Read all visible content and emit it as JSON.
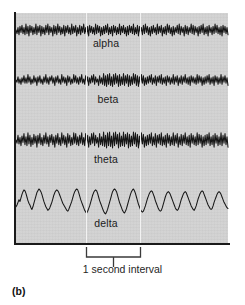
{
  "figure": {
    "panel_label": "(b)",
    "interval_caption": "1 second interval",
    "background_color": "#ffffff",
    "plot_background_color": "#d2d2d2",
    "trace_color": "#161616",
    "axis_color": "#1a1a1a",
    "marker_line_color": "#f2f2f2"
  },
  "bands": [
    {
      "label": "alpha",
      "label_x": 106,
      "label_y": 44,
      "baseline_y": 17,
      "amplitude": 6.0
    },
    {
      "label": "beta",
      "label_x": 108,
      "label_y": 100,
      "baseline_y": 67,
      "amplitude": 6.5
    },
    {
      "label": "theta",
      "label_x": 106,
      "label_y": 160,
      "baseline_y": 127,
      "amplitude": 8.0
    },
    {
      "label": "delta",
      "label_x": 106,
      "label_y": 224,
      "baseline_y": 192,
      "amplitude": 16.0
    }
  ],
  "interval_markers": {
    "x_start": 86,
    "x_end": 140,
    "label": "1 second interval"
  },
  "chart_data": {
    "type": "line",
    "title": "",
    "xlabel": "1 second interval",
    "ylabel": "",
    "grid": false,
    "legend": "inline-labels",
    "x_range": [
      0,
      212
    ],
    "series": [
      {
        "name": "alpha",
        "description": "Moderate-frequency, low-amplitude regular oscillation (~10 Hz)",
        "values": [
          0,
          -3,
          2,
          -4,
          3,
          -2,
          4,
          -3,
          2,
          -4,
          5,
          -3,
          3,
          -5,
          4,
          -2,
          3,
          -4,
          2,
          -3,
          5,
          -4,
          3,
          -2,
          4,
          -5,
          3,
          -3,
          2,
          -4,
          4,
          -2,
          5,
          -4,
          3,
          -2,
          2,
          -5,
          4,
          -3,
          3,
          -4,
          5,
          -2,
          3,
          -4,
          2,
          -3,
          4,
          -5,
          3,
          -2,
          4,
          -3,
          2,
          -4,
          5,
          -3,
          3,
          -2,
          4,
          -5,
          2,
          -3,
          4,
          -4,
          3,
          -2,
          5,
          -3,
          2,
          -4,
          3,
          -5,
          4,
          -2,
          3,
          -3,
          2,
          -4,
          5,
          -3,
          4,
          -2,
          3,
          -5,
          2,
          -4,
          3,
          -3,
          4,
          -2,
          5,
          -4,
          2,
          -3,
          3,
          -5,
          4,
          -2,
          3,
          -4,
          2,
          -3,
          5,
          -4,
          3,
          -2,
          4,
          -3,
          2,
          -5,
          3,
          -4,
          4,
          -2,
          3,
          -3,
          5,
          -4,
          2,
          -3,
          4,
          -5,
          3,
          -2,
          2,
          -4,
          4,
          -3,
          5,
          -2,
          3,
          -4,
          2,
          -5,
          3,
          -3,
          4,
          -2,
          2,
          -4,
          5,
          -3,
          3,
          -2,
          4,
          -5,
          2,
          -3,
          3,
          -4,
          5,
          -2,
          4,
          -3,
          2,
          -5,
          3,
          -4,
          2,
          -2,
          4,
          -3,
          5,
          -4,
          3,
          -2,
          2,
          -5,
          4,
          -3,
          3,
          -4,
          2,
          -2,
          5,
          -3,
          4,
          -4,
          3,
          -2,
          2,
          -5,
          3,
          -3,
          4,
          -2,
          5,
          -4,
          2,
          -3,
          3,
          -5,
          4,
          -2,
          2,
          -4,
          3,
          -3,
          5,
          -2,
          4,
          -3,
          2,
          -4,
          3,
          -5,
          4,
          -2,
          3,
          -3,
          2,
          -4
        ]
      },
      {
        "name": "beta",
        "description": "High-frequency, low-amplitude fast activity (~20 Hz) with a burst mid-trace",
        "values": [
          0,
          -2,
          3,
          -3,
          1,
          -4,
          2,
          -2,
          4,
          -3,
          2,
          -3,
          5,
          -2,
          3,
          -4,
          1,
          -3,
          4,
          -2,
          2,
          -5,
          3,
          -2,
          4,
          -3,
          1,
          -4,
          3,
          -2,
          5,
          -3,
          2,
          -4,
          3,
          -1,
          4,
          -3,
          2,
          -5,
          3,
          -2,
          4,
          -3,
          1,
          -4,
          5,
          -2,
          3,
          -3,
          2,
          -5,
          4,
          -2,
          3,
          -4,
          1,
          -3,
          5,
          -2,
          4,
          -3,
          2,
          -4,
          3,
          -2,
          5,
          -3,
          1,
          -4,
          4,
          -2,
          3,
          -5,
          2,
          -3,
          4,
          -2,
          5,
          -4,
          3,
          -2,
          1,
          -5,
          4,
          -3,
          2,
          -4,
          6,
          -5,
          4,
          -6,
          5,
          -4,
          6,
          -5,
          3,
          -6,
          5,
          -4,
          6,
          -3,
          4,
          -6,
          5,
          -5,
          3,
          -4,
          6,
          -5,
          4,
          -3,
          5,
          -6,
          4,
          -5,
          3,
          -4,
          6,
          -3,
          5,
          -5,
          4,
          -6,
          3,
          -4,
          5,
          -3,
          4,
          -5,
          2,
          -4,
          3,
          -3,
          4,
          -2,
          5,
          -4,
          2,
          -3,
          4,
          -5,
          3,
          -2,
          4,
          -3,
          5,
          -4,
          2,
          -3,
          3,
          -5,
          4,
          -2,
          3,
          -4,
          2,
          -3,
          5,
          -4,
          3,
          -2,
          4,
          -5,
          2,
          -3,
          4,
          -4,
          3,
          -2,
          5,
          -3,
          2,
          -4,
          3,
          -5,
          4,
          -2,
          3,
          -3,
          2,
          -4,
          5,
          -3,
          4,
          -2,
          3,
          -5,
          2,
          -4,
          3,
          -3,
          4,
          -2,
          5,
          -4,
          2,
          -3,
          3,
          -5,
          4,
          -2,
          3,
          -4,
          2,
          -3,
          5,
          -4,
          3,
          -2,
          4,
          -3,
          2,
          -5
        ]
      },
      {
        "name": "theta",
        "description": "Slower irregular waves (~5 Hz) with moderate amplitude",
        "values": [
          0,
          -4,
          6,
          -5,
          3,
          -7,
          5,
          -3,
          8,
          -6,
          4,
          -7,
          9,
          -5,
          6,
          -8,
          3,
          -6,
          7,
          -4,
          5,
          -9,
          6,
          -4,
          8,
          -6,
          3,
          -7,
          6,
          -4,
          9,
          -5,
          4,
          -8,
          6,
          -3,
          7,
          -6,
          4,
          -9,
          6,
          -4,
          8,
          -6,
          3,
          -7,
          9,
          -4,
          6,
          -6,
          4,
          -9,
          8,
          -4,
          6,
          -7,
          3,
          -6,
          9,
          -4,
          8,
          -6,
          4,
          -7,
          6,
          -4,
          9,
          -6,
          3,
          -7,
          8,
          -4,
          6,
          -9,
          4,
          -6,
          8,
          -4,
          9,
          -7,
          6,
          -4,
          3,
          -9,
          8,
          -6,
          4,
          -7,
          10,
          -8,
          6,
          -10,
          9,
          -7,
          10,
          -8,
          5,
          -10,
          9,
          -7,
          10,
          -5,
          7,
          -10,
          9,
          -8,
          5,
          -7,
          10,
          -8,
          7,
          -5,
          9,
          -10,
          7,
          -8,
          5,
          -7,
          10,
          -5,
          9,
          -8,
          7,
          -10,
          5,
          -7,
          9,
          -5,
          7,
          -9,
          4,
          -7,
          6,
          -6,
          7,
          -4,
          9,
          -7,
          4,
          -6,
          8,
          -9,
          6,
          -4,
          7,
          -6,
          9,
          -7,
          4,
          -6,
          6,
          -9,
          8,
          -4,
          6,
          -7,
          4,
          -6,
          9,
          -7,
          6,
          -4,
          8,
          -9,
          4,
          -6,
          7,
          -7,
          6,
          -4,
          9,
          -6,
          4,
          -7,
          6,
          -9,
          8,
          -4,
          6,
          -6,
          4,
          -7,
          9,
          -6,
          7,
          -4,
          6,
          -9,
          4,
          -7,
          6,
          -6,
          7,
          -4,
          9,
          -7,
          4,
          -6,
          6,
          -9,
          8,
          -4,
          6,
          -7,
          4,
          -6,
          9,
          -7,
          6,
          -4,
          8,
          -6,
          4,
          -9
        ]
      },
      {
        "name": "delta",
        "description": "Large-amplitude slow waves (~2 Hz)",
        "values": [
          -2,
          0,
          3,
          6,
          4,
          8,
          12,
          15,
          17,
          16,
          13,
          9,
          5,
          2,
          0,
          -3,
          -5,
          -2,
          2,
          6,
          10,
          14,
          16,
          18,
          17,
          15,
          12,
          8,
          4,
          1,
          -2,
          -4,
          -6,
          -5,
          -3,
          0,
          3,
          7,
          11,
          14,
          16,
          17,
          16,
          14,
          11,
          8,
          5,
          2,
          0,
          -2,
          -4,
          -6,
          -7,
          -5,
          -2,
          1,
          4,
          8,
          12,
          15,
          17,
          18,
          17,
          14,
          10,
          6,
          3,
          0,
          -3,
          -6,
          -8,
          -9,
          -7,
          -4,
          -1,
          3,
          7,
          11,
          14,
          16,
          17,
          16,
          13,
          9,
          5,
          2,
          -1,
          -4,
          -7,
          -9,
          -10,
          -8,
          -5,
          -1,
          3,
          7,
          11,
          15,
          17,
          18,
          17,
          15,
          11,
          7,
          3,
          0,
          -3,
          -6,
          -8,
          -9,
          -7,
          -4,
          0,
          4,
          8,
          12,
          15,
          17,
          18,
          16,
          13,
          9,
          5,
          1,
          -2,
          -5,
          -7,
          -8,
          -7,
          -4,
          -1,
          3,
          7,
          10,
          13,
          15,
          16,
          15,
          12,
          9,
          5,
          2,
          -1,
          -4,
          -6,
          -7,
          -6,
          -3,
          1,
          5,
          9,
          12,
          14,
          15,
          14,
          12,
          9,
          6,
          3,
          0,
          -3,
          -5,
          -6,
          -5,
          -2,
          2,
          6,
          9,
          12,
          14,
          15,
          14,
          11,
          8,
          5,
          2,
          -1,
          -3,
          -5,
          -6,
          -4,
          -1,
          3,
          7,
          10,
          13,
          15,
          16,
          15,
          12,
          9,
          6,
          3,
          0,
          -2,
          -4,
          -5,
          -4,
          -1,
          3,
          6,
          9,
          12,
          14,
          15,
          14,
          12,
          9,
          6,
          3,
          1,
          -1,
          -3,
          -4
        ]
      }
    ]
  }
}
